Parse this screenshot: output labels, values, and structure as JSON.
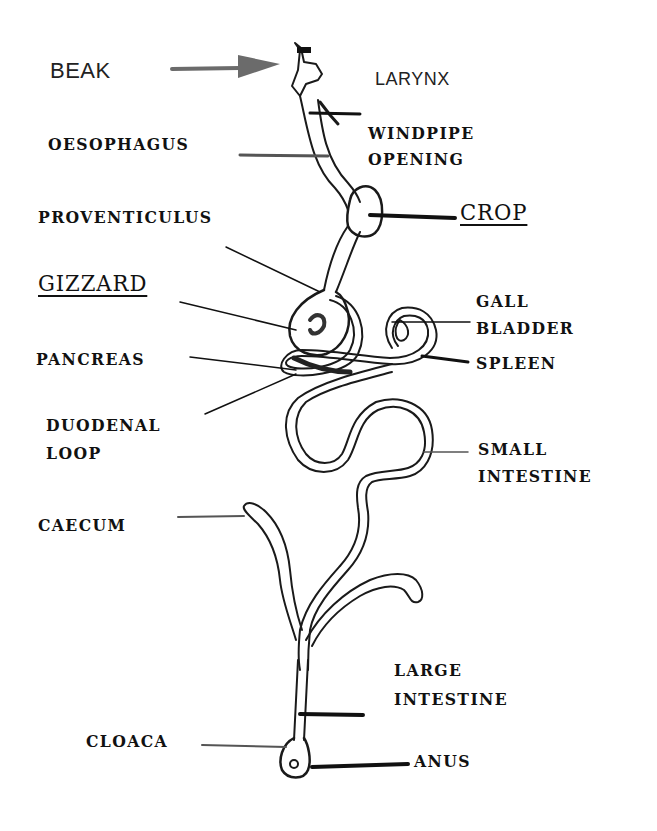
{
  "diagram": {
    "labels": {
      "beak": "BEAK",
      "larynx": "LARYNX",
      "windpipe_opening_1": "WINDPIPE",
      "windpipe_opening_2": "OPENING",
      "oesophagus": "OESOPHAGUS",
      "crop": "CROP",
      "proventiculus": "PROVENTICULUS",
      "gizzard": "GIZZARD",
      "gall_bladder_1": "GALL",
      "gall_bladder_2": "BLADDER",
      "pancreas": "PANCREAS",
      "spleen": "SPLEEN",
      "duodenal_loop_1": "DUODENAL",
      "duodenal_loop_2": "LOOP",
      "small_intestine_1": "SMALL",
      "small_intestine_2": "INTESTINE",
      "caecum": "CAECUM",
      "large_intestine_1": "LARGE",
      "large_intestine_2": "INTESTINE",
      "cloaca": "CLOACA",
      "anus": "ANUS"
    },
    "colors": {
      "ink": "#111111",
      "arrow": "#6b6b6b",
      "background": "#ffffff"
    }
  }
}
